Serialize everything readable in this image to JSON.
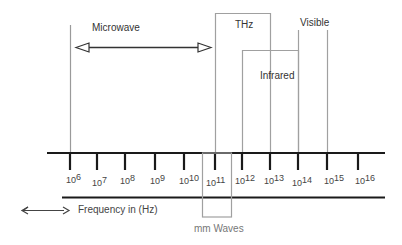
{
  "diagram": {
    "bands": {
      "microwave": "Microwave",
      "thz": "THz",
      "infrared": "Infrared",
      "visible": "Visible",
      "mm_waves": "mm Waves"
    },
    "axis": {
      "base": "10",
      "exponents": [
        "6",
        "7",
        "8",
        "9",
        "10",
        "11",
        "12",
        "13",
        "14",
        "15",
        "16"
      ]
    },
    "legend": {
      "icon": "double-arrow-icon",
      "label": "Frequency in (Hz)"
    },
    "colors": {
      "axis": "#1a1a1a",
      "band_lines": "#a0a0a0",
      "text": "#333333"
    }
  }
}
